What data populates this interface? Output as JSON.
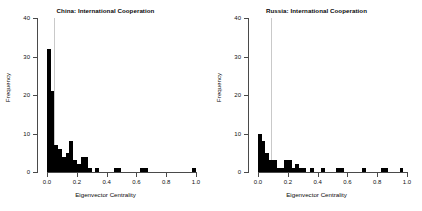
{
  "figure": {
    "panel_count": 2,
    "background": "#ffffff",
    "bar_color": "#000000",
    "refline_color": "#c9c9c9"
  },
  "chart_data": [
    {
      "type": "bar",
      "title": "China: International Cooperation",
      "xlabel": "Eigenvector Centrality",
      "ylabel": "Frequency",
      "xlim": [
        0.0,
        1.0
      ],
      "ylim": [
        0,
        40
      ],
      "xticks": [
        0.0,
        0.2,
        0.4,
        0.6,
        0.8,
        1.0
      ],
      "xtick_labels": [
        "0.0",
        "0.2",
        "0.4",
        "0.6",
        "0.8",
        "1.0"
      ],
      "yticks": [
        0,
        10,
        20,
        30,
        40
      ],
      "ytick_labels": [
        "0",
        "10",
        "20",
        "30",
        "40"
      ],
      "grid": false,
      "legend": false,
      "bin_width": 0.025,
      "reference_line_x": 0.05,
      "bin_starts": [
        0.0,
        0.025,
        0.05,
        0.075,
        0.1,
        0.125,
        0.15,
        0.175,
        0.2,
        0.225,
        0.25,
        0.275,
        0.3,
        0.325,
        0.35,
        0.375,
        0.4,
        0.425,
        0.45,
        0.475,
        0.5,
        0.525,
        0.55,
        0.575,
        0.6,
        0.625,
        0.65,
        0.675,
        0.7,
        0.725,
        0.75,
        0.775,
        0.8,
        0.825,
        0.85,
        0.875,
        0.9,
        0.925,
        0.95,
        0.975
      ],
      "values": [
        32,
        21,
        7,
        6,
        4,
        5,
        8,
        3,
        2,
        4,
        4,
        1,
        0,
        1,
        0,
        0,
        0,
        0,
        1,
        1,
        0,
        0,
        0,
        0,
        0,
        1,
        1,
        0,
        0,
        0,
        0,
        0,
        0,
        0,
        0,
        0,
        0,
        0,
        0,
        1
      ]
    },
    {
      "type": "bar",
      "title": "Russia: International Cooperation",
      "xlabel": "Eigenvector Centrality",
      "ylabel": "Frequency",
      "xlim": [
        0.0,
        1.0
      ],
      "ylim": [
        0,
        40
      ],
      "xticks": [
        0.0,
        0.2,
        0.4,
        0.6,
        0.8,
        1.0
      ],
      "xtick_labels": [
        "0.0",
        "0.2",
        "0.4",
        "0.6",
        "0.8",
        "1.0"
      ],
      "yticks": [
        0,
        10,
        20,
        30,
        40
      ],
      "ytick_labels": [
        "0",
        "10",
        "20",
        "30",
        "40"
      ],
      "grid": false,
      "legend": false,
      "bin_width": 0.025,
      "reference_line_x": 0.09,
      "bin_starts": [
        0.0,
        0.025,
        0.05,
        0.075,
        0.1,
        0.125,
        0.15,
        0.175,
        0.2,
        0.225,
        0.25,
        0.275,
        0.3,
        0.325,
        0.35,
        0.375,
        0.4,
        0.425,
        0.45,
        0.475,
        0.5,
        0.525,
        0.55,
        0.575,
        0.6,
        0.625,
        0.65,
        0.675,
        0.7,
        0.725,
        0.75,
        0.775,
        0.8,
        0.825,
        0.85,
        0.875,
        0.9,
        0.925,
        0.95,
        0.975
      ],
      "values": [
        10,
        8,
        5,
        3,
        3,
        1,
        1,
        3,
        3,
        1,
        2,
        1,
        1,
        0,
        1,
        0,
        0,
        1,
        0,
        0,
        0,
        1,
        1,
        0,
        0,
        0,
        0,
        0,
        1,
        0,
        0,
        0,
        0,
        1,
        1,
        0,
        0,
        0,
        1,
        0
      ]
    }
  ]
}
